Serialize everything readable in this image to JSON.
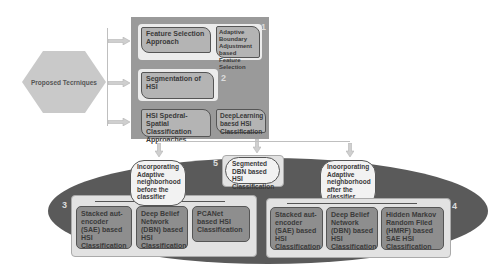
{
  "root": {
    "label": "Proposed Tecrniques"
  },
  "panel": {
    "sections": [
      {
        "number": "1",
        "left": "Feature Selection Approach",
        "right": "Adaptive Boundary Adjustment based Feature Selection"
      },
      {
        "number": "2",
        "left": "Segmentation of HSI"
      },
      {
        "left": "HSI Spedral-Spatial Classification Approaches",
        "right": "DeepLearning baesd HSI Classification"
      }
    ]
  },
  "lower": {
    "left_oval": "Incorporating Adaptive neighborhood before the classifier",
    "center_number": "5",
    "center_oval": "Segmented DBN based HSI Classification",
    "right_oval": "Inoorporating Adaptive neighborhood after the classifier",
    "group3": {
      "number": "3",
      "items": [
        "Stacked aut-encoder (SAE) based HSI Classification",
        "Deep Belief Network (DBN) based HSI Classification",
        "PCANet based HSI Classification"
      ]
    },
    "group4": {
      "number": "4",
      "items": [
        "Stacked aut-encoder (SAE) based HSI Classification",
        "Deep Belief Network (DBN) based HSI Classification",
        "Hidden Markov Random Filed (HMRF) based SAE HSI Classification"
      ]
    }
  },
  "colors": {
    "panel": "#9a9a9a",
    "ellipse": "#5a5a5a",
    "box": "#b4b4b4",
    "subbox": "#8e8e8e"
  }
}
